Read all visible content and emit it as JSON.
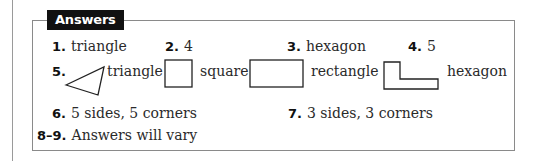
{
  "header": {
    "label": "Answers"
  },
  "answers": [
    {
      "num": "1.",
      "text": "triangle"
    },
    {
      "num": "2.",
      "text": "4"
    },
    {
      "num": "3.",
      "text": "hexagon"
    },
    {
      "num": "4.",
      "text": "5"
    },
    {
      "num": "5.",
      "shapes": [
        {
          "shape": "triangle-icon",
          "label": "triangle"
        },
        {
          "shape": "square-icon",
          "label": "square"
        },
        {
          "shape": "rectangle-icon",
          "label": "rectangle"
        },
        {
          "shape": "l-hexagon-icon",
          "label": "hexagon"
        }
      ]
    },
    {
      "num": "6.",
      "text": "5 sides, 5 corners"
    },
    {
      "num": "7.",
      "text": "3 sides, 3 corners"
    },
    {
      "num": "8–9.",
      "text": "Answers will vary"
    }
  ],
  "colors": {
    "label_bg": "#111111",
    "label_text": "#ffffff",
    "border": "#8a8a8a",
    "text": "#2a2a2a"
  }
}
